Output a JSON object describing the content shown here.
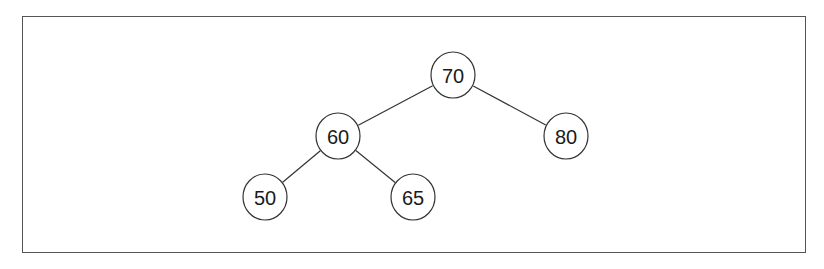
{
  "diagram": {
    "type": "binary-search-tree",
    "nodes": [
      {
        "id": "n70",
        "label": "70",
        "cx": 453,
        "cy": 75
      },
      {
        "id": "n60",
        "label": "60",
        "cx": 338,
        "cy": 136
      },
      {
        "id": "n80",
        "label": "80",
        "cx": 566,
        "cy": 136
      },
      {
        "id": "n50",
        "label": "50",
        "cx": 265,
        "cy": 197
      },
      {
        "id": "n65",
        "label": "65",
        "cx": 413,
        "cy": 197
      }
    ],
    "edges": [
      {
        "from": "n70",
        "to": "n60"
      },
      {
        "from": "n70",
        "to": "n80"
      },
      {
        "from": "n60",
        "to": "n50"
      },
      {
        "from": "n60",
        "to": "n65"
      }
    ],
    "node_radius": 23
  }
}
